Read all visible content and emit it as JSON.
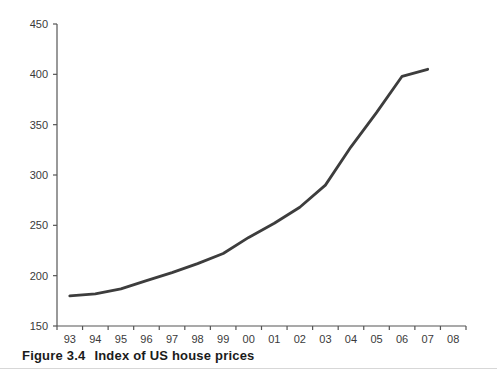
{
  "figure": {
    "caption_label": "Figure 3.4",
    "caption_title": "Index of US house prices"
  },
  "chart_data": {
    "type": "line",
    "title": "",
    "xlabel": "",
    "ylabel": "",
    "categories": [
      "93",
      "94",
      "95",
      "96",
      "97",
      "98",
      "99",
      "00",
      "01",
      "02",
      "03",
      "04",
      "05",
      "06",
      "07",
      "08"
    ],
    "series": [
      {
        "name": "US house price index",
        "values": [
          180,
          182,
          187,
          195,
          203,
          212,
          222,
          238,
          252,
          268,
          290,
          328,
          362,
          398,
          405,
          null
        ]
      }
    ],
    "ylim": [
      150,
      450
    ],
    "y_ticks": [
      150,
      200,
      250,
      300,
      350,
      400,
      450
    ],
    "grid": false,
    "legend": false,
    "colors": {
      "line": "#3d3d3d",
      "axis": "#555555",
      "tick_label": "#3a3a3a"
    }
  }
}
